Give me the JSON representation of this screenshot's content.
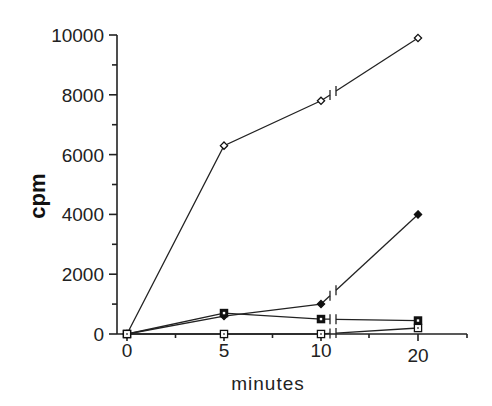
{
  "chart_data": {
    "type": "line",
    "title": "",
    "xlabel": "minutes",
    "ylabel": "cpm",
    "x": [
      0,
      5,
      10,
      20
    ],
    "x_tick_labels": [
      "0",
      "5",
      "10",
      "20"
    ],
    "y_tick_labels": [
      "0",
      "2000",
      "4000",
      "6000",
      "8000",
      "10000"
    ],
    "ylim": [
      0,
      10000
    ],
    "xlim": [
      0,
      25
    ],
    "x_axis_break": "between 10 and 20",
    "grid": false,
    "legend": null,
    "series": [
      {
        "name": "open diamond",
        "marker": "open-diamond",
        "values": [
          0,
          6300,
          7800,
          9900
        ]
      },
      {
        "name": "filled diamond",
        "marker": "filled-diamond",
        "values": [
          0,
          600,
          1000,
          4000
        ]
      },
      {
        "name": "filled square",
        "marker": "filled-square",
        "values": [
          0,
          700,
          500,
          450
        ]
      },
      {
        "name": "open square",
        "marker": "open-square",
        "values": [
          0,
          0,
          0,
          200
        ]
      }
    ]
  }
}
